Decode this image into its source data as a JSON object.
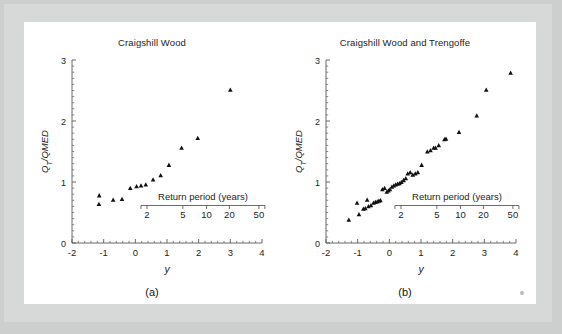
{
  "figure": {
    "background_color": "#d7d8d8",
    "panel_color": "#ffffff",
    "marker_color": "#111111",
    "axis_color": "#5a5a5a",
    "text_color": "#1c1c1c",
    "corner_mark": "corner-dot"
  },
  "panels": [
    {
      "letter": "(a)",
      "title": "Craigshill Wood"
    },
    {
      "letter": "(b)",
      "title": "Craigshill Wood and Trengoffe"
    }
  ],
  "axes": {
    "xlabel": "y",
    "ylabel": "QT/QMED",
    "ylabel_parts": {
      "q": "Q",
      "sub": "T",
      "rest": "/QMED"
    },
    "xticks": [
      "-2",
      "-1",
      "0",
      "1",
      "2",
      "3",
      "4"
    ],
    "xtick_values": [
      -2,
      -1,
      0,
      1,
      2,
      3,
      4
    ],
    "yticks": [
      "0",
      "1",
      "2",
      "3"
    ],
    "ytick_values": [
      0,
      1,
      2,
      3
    ],
    "xlim": [
      -2,
      4
    ],
    "ylim": [
      0,
      3
    ],
    "secondary_axis": {
      "label": "Return period (years)",
      "ticks": [
        "2",
        "5",
        "10",
        "20",
        "50"
      ],
      "tick_values": [
        2,
        5,
        10,
        20,
        50
      ],
      "tick_y_positions": [
        0.367,
        1.5,
        2.25,
        2.97,
        3.902
      ]
    }
  },
  "chart_data": [
    {
      "type": "scatter",
      "title": "Craigshill Wood",
      "xlabel": "y",
      "ylabel": "QT/QMED",
      "xlim": [
        -2,
        4
      ],
      "ylim": [
        0,
        3
      ],
      "grid": false,
      "legend": null,
      "marker": "triangle",
      "secondary_xaxis": {
        "label": "Return period (years)",
        "ticks": [
          2,
          5,
          10,
          20,
          50
        ]
      },
      "points": [
        {
          "x": -1.14,
          "y": 0.78
        },
        {
          "x": -1.15,
          "y": 0.64
        },
        {
          "x": -0.7,
          "y": 0.71
        },
        {
          "x": -0.42,
          "y": 0.72
        },
        {
          "x": -0.16,
          "y": 0.9
        },
        {
          "x": 0.04,
          "y": 0.93
        },
        {
          "x": 0.18,
          "y": 0.94
        },
        {
          "x": 0.33,
          "y": 0.96
        },
        {
          "x": 0.56,
          "y": 1.04
        },
        {
          "x": 0.8,
          "y": 1.11
        },
        {
          "x": 1.06,
          "y": 1.28
        },
        {
          "x": 1.46,
          "y": 1.56
        },
        {
          "x": 1.97,
          "y": 1.72
        },
        {
          "x": 3.0,
          "y": 2.51
        }
      ]
    },
    {
      "type": "scatter",
      "title": "Craigshill Wood and Trengoffe",
      "xlabel": "y",
      "ylabel": "QT/QMED",
      "xlim": [
        -2,
        4
      ],
      "ylim": [
        0,
        3
      ],
      "grid": false,
      "legend": null,
      "marker": "triangle",
      "secondary_xaxis": {
        "label": "Return period (years)",
        "ticks": [
          2,
          5,
          10,
          20,
          50
        ]
      },
      "points": [
        {
          "x": -1.28,
          "y": 0.38
        },
        {
          "x": -1.02,
          "y": 0.66
        },
        {
          "x": -0.96,
          "y": 0.47
        },
        {
          "x": -0.82,
          "y": 0.56
        },
        {
          "x": -0.76,
          "y": 0.57
        },
        {
          "x": -0.7,
          "y": 0.71
        },
        {
          "x": -0.66,
          "y": 0.6
        },
        {
          "x": -0.58,
          "y": 0.62
        },
        {
          "x": -0.5,
          "y": 0.66
        },
        {
          "x": -0.44,
          "y": 0.67
        },
        {
          "x": -0.38,
          "y": 0.68
        },
        {
          "x": -0.33,
          "y": 0.69
        },
        {
          "x": -0.28,
          "y": 0.7
        },
        {
          "x": -0.22,
          "y": 0.88
        },
        {
          "x": -0.15,
          "y": 0.9
        },
        {
          "x": -0.08,
          "y": 0.84
        },
        {
          "x": -0.03,
          "y": 0.86
        },
        {
          "x": 0.02,
          "y": 0.88
        },
        {
          "x": 0.08,
          "y": 0.92
        },
        {
          "x": 0.14,
          "y": 0.94
        },
        {
          "x": 0.2,
          "y": 0.96
        },
        {
          "x": 0.26,
          "y": 0.97
        },
        {
          "x": 0.32,
          "y": 0.98
        },
        {
          "x": 0.38,
          "y": 1.0
        },
        {
          "x": 0.45,
          "y": 1.03
        },
        {
          "x": 0.52,
          "y": 1.06
        },
        {
          "x": 0.58,
          "y": 1.14
        },
        {
          "x": 0.66,
          "y": 1.16
        },
        {
          "x": 0.74,
          "y": 1.12
        },
        {
          "x": 0.82,
          "y": 1.14
        },
        {
          "x": 0.9,
          "y": 1.16
        },
        {
          "x": 1.02,
          "y": 1.28
        },
        {
          "x": 1.2,
          "y": 1.5
        },
        {
          "x": 1.3,
          "y": 1.52
        },
        {
          "x": 1.4,
          "y": 1.56
        },
        {
          "x": 1.46,
          "y": 1.56
        },
        {
          "x": 1.56,
          "y": 1.6
        },
        {
          "x": 1.74,
          "y": 1.7
        },
        {
          "x": 1.79,
          "y": 1.71
        },
        {
          "x": 2.2,
          "y": 1.82
        },
        {
          "x": 2.76,
          "y": 2.09
        },
        {
          "x": 3.06,
          "y": 2.51
        },
        {
          "x": 3.83,
          "y": 2.79
        }
      ]
    }
  ]
}
